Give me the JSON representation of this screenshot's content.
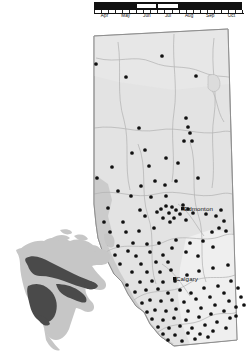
{
  "figure": {
    "kind": "species-distribution-map",
    "region_title": "Alberta",
    "inset_title": "North America"
  },
  "phenology": {
    "label": "flight period",
    "months": [
      "Apr",
      "May",
      "Jun",
      "Jul",
      "Aug",
      "Sep",
      "Oct"
    ],
    "bar_color": "#111111",
    "highlight_color": "#ffffff",
    "highlight_start_month": "Jun",
    "highlight_end_month": "Aug",
    "highlight_divider_month": "Jul",
    "axis_start": "Apr",
    "axis_end": "Oct"
  },
  "map": {
    "fill_color": "#e3e3e3",
    "mountain_color": "#c9c9c9",
    "prairie_color": "#eeeeee",
    "border_color": "#9a9a9a",
    "river_color": "#b4b4b4",
    "point_color": "#111111",
    "cities": [
      {
        "name": "Edmonton",
        "x": 184,
        "y": 205
      },
      {
        "name": "Calgary",
        "x": 176,
        "y": 275
      }
    ],
    "occurrence_points": [
      [
        96,
        64
      ],
      [
        162,
        56
      ],
      [
        126,
        77
      ],
      [
        196,
        76
      ],
      [
        186,
        118
      ],
      [
        188,
        127
      ],
      [
        190,
        133
      ],
      [
        184,
        141
      ],
      [
        192,
        141
      ],
      [
        139,
        128
      ],
      [
        145,
        150
      ],
      [
        166,
        158
      ],
      [
        149,
        166
      ],
      [
        97,
        178
      ],
      [
        112,
        167
      ],
      [
        132,
        153
      ],
      [
        141,
        186
      ],
      [
        178,
        163
      ],
      [
        131,
        196
      ],
      [
        118,
        191
      ],
      [
        155,
        181
      ],
      [
        165,
        185
      ],
      [
        166,
        196
      ],
      [
        151,
        197
      ],
      [
        176,
        181
      ],
      [
        198,
        178
      ],
      [
        140,
        210
      ],
      [
        108,
        208
      ],
      [
        123,
        222
      ],
      [
        145,
        216
      ],
      [
        126,
        232
      ],
      [
        139,
        231
      ],
      [
        154,
        228
      ],
      [
        169,
        213
      ],
      [
        172,
        207
      ],
      [
        176,
        210
      ],
      [
        180,
        214
      ],
      [
        166,
        206
      ],
      [
        161,
        209
      ],
      [
        157,
        212
      ],
      [
        174,
        218
      ],
      [
        183,
        205
      ],
      [
        188,
        209
      ],
      [
        170,
        222
      ],
      [
        163,
        218
      ],
      [
        186,
        220
      ],
      [
        193,
        213
      ],
      [
        206,
        214
      ],
      [
        216,
        216
      ],
      [
        221,
        210
      ],
      [
        224,
        221
      ],
      [
        219,
        228
      ],
      [
        226,
        231
      ],
      [
        212,
        232
      ],
      [
        133,
        243
      ],
      [
        147,
        244
      ],
      [
        159,
        243
      ],
      [
        176,
        240
      ],
      [
        190,
        243
      ],
      [
        203,
        241
      ],
      [
        213,
        247
      ],
      [
        136,
        256
      ],
      [
        150,
        252
      ],
      [
        163,
        255
      ],
      [
        141,
        264
      ],
      [
        156,
        262
      ],
      [
        168,
        262
      ],
      [
        128,
        251
      ],
      [
        118,
        246
      ],
      [
        186,
        252
      ],
      [
        198,
        256
      ],
      [
        172,
        248
      ],
      [
        147,
        272
      ],
      [
        160,
        272
      ],
      [
        171,
        270
      ],
      [
        132,
        272
      ],
      [
        120,
        264
      ],
      [
        152,
        281
      ],
      [
        140,
        282
      ],
      [
        163,
        282
      ],
      [
        175,
        281
      ],
      [
        187,
        275
      ],
      [
        199,
        271
      ],
      [
        213,
        268
      ],
      [
        228,
        265
      ],
      [
        146,
        290
      ],
      [
        158,
        289
      ],
      [
        168,
        293
      ],
      [
        135,
        292
      ],
      [
        127,
        285
      ],
      [
        180,
        290
      ],
      [
        191,
        293
      ],
      [
        204,
        288
      ],
      [
        218,
        286
      ],
      [
        231,
        281
      ],
      [
        150,
        300
      ],
      [
        161,
        301
      ],
      [
        142,
        303
      ],
      [
        172,
        300
      ],
      [
        184,
        302
      ],
      [
        196,
        299
      ],
      [
        210,
        297
      ],
      [
        224,
        293
      ],
      [
        238,
        288
      ],
      [
        155,
        310
      ],
      [
        166,
        311
      ],
      [
        147,
        312
      ],
      [
        176,
        309
      ],
      [
        188,
        311
      ],
      [
        201,
        308
      ],
      [
        215,
        305
      ],
      [
        229,
        301
      ],
      [
        241,
        297
      ],
      [
        152,
        319
      ],
      [
        163,
        320
      ],
      [
        174,
        318
      ],
      [
        186,
        320
      ],
      [
        199,
        317
      ],
      [
        211,
        314
      ],
      [
        224,
        311
      ],
      [
        236,
        307
      ],
      [
        158,
        327
      ],
      [
        169,
        328
      ],
      [
        180,
        326
      ],
      [
        192,
        328
      ],
      [
        205,
        325
      ],
      [
        217,
        322
      ],
      [
        230,
        318
      ],
      [
        163,
        334
      ],
      [
        175,
        335
      ],
      [
        188,
        333
      ],
      [
        200,
        334
      ],
      [
        213,
        331
      ],
      [
        226,
        328
      ],
      [
        168,
        340
      ],
      [
        182,
        341
      ],
      [
        195,
        339
      ],
      [
        208,
        337
      ],
      [
        236,
        316
      ],
      [
        244,
        305
      ],
      [
        110,
        232
      ],
      [
        104,
        222
      ],
      [
        115,
        255
      ],
      [
        109,
        244
      ]
    ]
  },
  "inset": {
    "land_color": "#c6c6c6",
    "range_color": "#4a4a4a",
    "ocean_color": "#ffffff",
    "range_label": "species range"
  }
}
